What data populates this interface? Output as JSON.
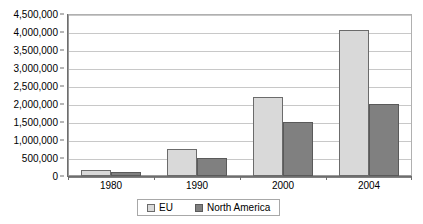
{
  "chart_data": {
    "type": "bar",
    "title": "",
    "xlabel": "",
    "ylabel": "",
    "categories": [
      "1980",
      "1990",
      "2000",
      "2004"
    ],
    "series": [
      {
        "name": "EU",
        "color": "#d9d9d9",
        "values": [
          170000,
          750000,
          2200000,
          4050000
        ]
      },
      {
        "name": "North America",
        "color": "#808080",
        "values": [
          110000,
          500000,
          1500000,
          2000000
        ]
      }
    ],
    "ylim": [
      0,
      4500000
    ],
    "ytick_step": 500000,
    "ytick_labels": [
      "4,500,000",
      "4,000,000",
      "3,500,000",
      "3,000,000",
      "2,500,000",
      "2,000,000",
      "1,500,000",
      "1,000,000",
      "500,000",
      "0"
    ],
    "grid": true,
    "legend_position": "bottom"
  },
  "legend": {
    "items": [
      {
        "label": "EU"
      },
      {
        "label": "North America"
      }
    ]
  }
}
